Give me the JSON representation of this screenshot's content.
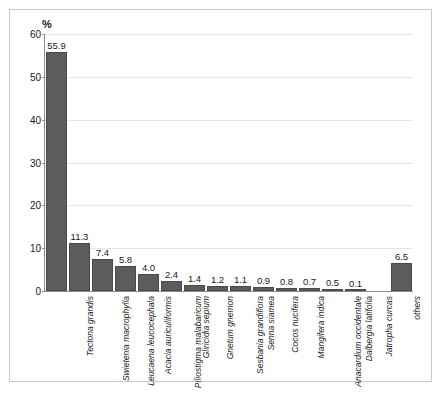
{
  "chart_data": {
    "type": "bar",
    "title": "",
    "subtitle": "",
    "xlabel": "",
    "ylabel": "%",
    "ylim": [
      0,
      60
    ],
    "yticks": [
      0,
      10,
      20,
      30,
      40,
      50,
      60
    ],
    "grid": true,
    "legend": "none",
    "orientation": "vertical",
    "bar_color": "#5c5c5c",
    "categories": [
      "Tectona grandis",
      "Swietenia macrophylla",
      "Leucaena leucocephala",
      "Acacia auriculiformis",
      "Piliostigma malabaricum",
      "Gliricidia sepium",
      "Gnetum gnemon",
      "Sesbania grandiflora",
      "Senna siamea",
      "Cocos nucifera",
      "Mangifera indica",
      "Anacardium occidentale",
      "Dalbergia latifolia",
      "Jatropha curcas",
      "others"
    ],
    "values": [
      55.9,
      11.3,
      7.4,
      5.8,
      4.0,
      2.4,
      1.4,
      1.2,
      1.1,
      0.9,
      0.8,
      0.7,
      0.5,
      0.1,
      6.5
    ],
    "value_labels": [
      "55.9",
      "11.3",
      "7.4",
      "5.8",
      "4.0",
      "2.4",
      "1.4",
      "1.2",
      "1.1",
      "0.9",
      "0.8",
      "0.7",
      "0.5",
      "0.1",
      "6.5"
    ],
    "ytick_labels": [
      "0",
      "10",
      "20",
      "30",
      "40",
      "50",
      "60"
    ],
    "gap_before_last_bar": true
  },
  "colors": {
    "bar": "#5c5c5c",
    "bar_edge": "#4a4a4a",
    "grid": "#e6e6e6",
    "axis": "#8c8c8c",
    "frame": "#c8c8c8",
    "text": "#1a1a1a"
  }
}
